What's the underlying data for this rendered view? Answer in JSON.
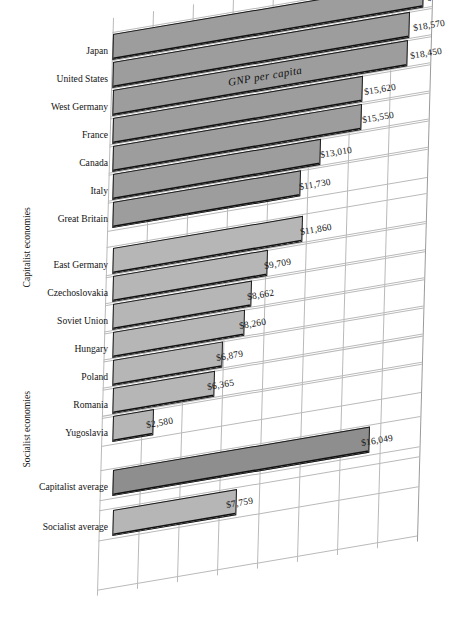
{
  "chart_data": {
    "type": "bar",
    "title": "GNP per capita",
    "xlabel": "",
    "ylabel": "",
    "orientation": "horizontal",
    "style": "skewed-perspective-bar",
    "grid": true,
    "legend": null,
    "xlim": [
      0,
      20000
    ],
    "gridline_step": 2500,
    "value_prefix": "$",
    "groups": [
      {
        "name": "Capitalist economies",
        "categories": [
          "Japan",
          "United States",
          "West Germany",
          "France",
          "Canada",
          "Italy",
          "Great Britain"
        ],
        "values": [
          19410,
          18570,
          18450,
          15620,
          15550,
          13010,
          11730
        ],
        "value_labels": [
          "$19,410",
          "$18,570",
          "$18,450",
          "$15,620",
          "$15,550",
          "$13,010",
          "$11,730"
        ]
      },
      {
        "name": "Socialist economies",
        "categories": [
          "East Germany",
          "Czechoslovakia",
          "Soviet Union",
          "Hungary",
          "Poland",
          "Romania",
          "Yugoslavia"
        ],
        "values": [
          11860,
          9709,
          8662,
          8260,
          6879,
          6365,
          2580
        ],
        "value_labels": [
          "$11,860",
          "$9,709",
          "$8,662",
          "$8,260",
          "$6,879",
          "$6,365",
          "$2,580"
        ]
      },
      {
        "name": "Averages",
        "categories": [
          "Capitalist average",
          "Socialist average"
        ],
        "values": [
          16049,
          7759
        ],
        "value_labels": [
          "$16,049",
          "$7,759"
        ]
      }
    ]
  },
  "axis_titles": {
    "capitalist": "Capitalist economies",
    "socialist": "Socialist economies"
  },
  "rows": [
    {
      "label": "Japan",
      "value_label": "$19,410",
      "value": 19410,
      "shade": "mid"
    },
    {
      "label": "United States",
      "value_label": "$18,570",
      "value": 18570,
      "shade": "mid"
    },
    {
      "label": "West Germany",
      "value_label": "$18,450",
      "value": 18450,
      "shade": "mid"
    },
    {
      "label": "France",
      "value_label": "$15,620",
      "value": 15620,
      "shade": "mid"
    },
    {
      "label": "Canada",
      "value_label": "$15,550",
      "value": 15550,
      "shade": "mid"
    },
    {
      "label": "Italy",
      "value_label": "$13,010",
      "value": 13010,
      "shade": "mid"
    },
    {
      "label": "Great Britain",
      "value_label": "$11,730",
      "value": 11730,
      "shade": "mid"
    },
    {
      "label": "East Germany",
      "value_label": "$11,860",
      "value": 11860,
      "shade": "light"
    },
    {
      "label": "Czechoslovakia",
      "value_label": "$9,709",
      "value": 9709,
      "shade": "light"
    },
    {
      "label": "Soviet Union",
      "value_label": "$8,662",
      "value": 8662,
      "shade": "light"
    },
    {
      "label": "Hungary",
      "value_label": "$8,260",
      "value": 8260,
      "shade": "light"
    },
    {
      "label": "Poland",
      "value_label": "$6,879",
      "value": 6879,
      "shade": "light"
    },
    {
      "label": "Romania",
      "value_label": "$6,365",
      "value": 6365,
      "shade": "light"
    },
    {
      "label": "Yugoslavia",
      "value_label": "$2,580",
      "value": 2580,
      "shade": "light"
    },
    {
      "label": "Capitalist average",
      "value_label": "$16,049",
      "value": 16049,
      "shade": "dark"
    },
    {
      "label": "Socialist average",
      "value_label": "$7,759",
      "value": 7759,
      "shade": "light"
    }
  ],
  "colors": {
    "bar_mid": "#9d9d9d",
    "bar_light": "#b6b6b6",
    "bar_dark": "#8e8e8e",
    "bar_outline": "#1a1a1a",
    "grid": "#b9b9b9",
    "text": "#131313",
    "background": "#ffffff"
  }
}
